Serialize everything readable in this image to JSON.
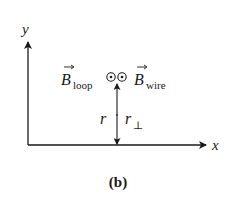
{
  "diagram": {
    "axes": {
      "x_label": "x",
      "y_label": "y"
    },
    "field_labels": {
      "loop_symbol": "B",
      "loop_subscript": "loop",
      "wire_symbol": "B",
      "wire_subscript": "wire"
    },
    "field_direction_icon": "dot-in-circle (out of page)",
    "distance_labels": {
      "r": "r",
      "r_perp_symbol": "r",
      "r_perp_subscript": "⊥"
    },
    "caption": "(b)",
    "colors": {
      "ink": "#1a1a1a",
      "background": "#ffffff"
    }
  }
}
